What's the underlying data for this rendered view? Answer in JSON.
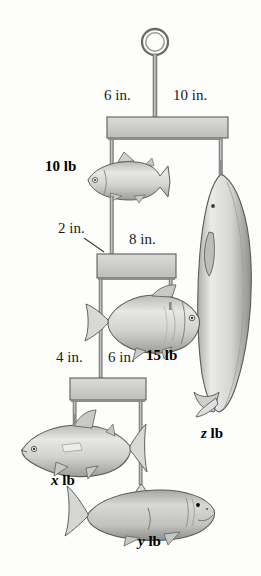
{
  "diagram": {
    "palette": {
      "beam_fill_light": "#d4d4d2",
      "beam_fill_dark": "#b4b4b2",
      "outline": "#4a4a4a",
      "rod": "#8c8c8c",
      "fish_light": "#efefed",
      "fish_mid": "#c8c8c6",
      "fish_dark": "#8f8f8d",
      "background": "#fdfdfc",
      "text": "#111111"
    },
    "hanger": {
      "ring_label": "support-ring",
      "ring_center_x": 155,
      "ring_center_y": 42,
      "ring_radius": 13
    },
    "beams": [
      {
        "name": "top-beam",
        "left_arm_in": 6,
        "right_arm_in": 10,
        "x": 107,
        "y": 117,
        "width": 121,
        "height": 21
      },
      {
        "name": "middle-beam",
        "left_arm_in": 2,
        "right_arm_in": 8,
        "x": 97,
        "y": 254,
        "width": 79,
        "height": 24
      },
      {
        "name": "bottom-beam",
        "left_arm_in": 4,
        "right_arm_in": 6,
        "x": 70,
        "y": 378,
        "width": 76,
        "height": 22
      }
    ],
    "dimension_labels": [
      {
        "id": "d1",
        "text": "6 in.",
        "x": 104,
        "y": 96
      },
      {
        "id": "d2",
        "text": "10 in.",
        "x": 175,
        "y": 96
      },
      {
        "id": "d3",
        "text": "2 in.",
        "x": 60,
        "y": 228
      },
      {
        "id": "d4",
        "text": "8 in.",
        "x": 130,
        "y": 238
      },
      {
        "id": "d5",
        "text": "4 in.",
        "x": 57,
        "y": 356
      },
      {
        "id": "d6",
        "text": "6 in.",
        "x": 109,
        "y": 356
      }
    ],
    "weight_labels": [
      {
        "id": "w1",
        "text": "10 lb",
        "x": 46,
        "y": 164,
        "kind": "known"
      },
      {
        "id": "w2",
        "text": "15 lb",
        "x": 147,
        "y": 352,
        "kind": "known"
      },
      {
        "id": "w3",
        "text": "x lb",
        "var": "x",
        "unit": "lb",
        "x": 51,
        "y": 477,
        "kind": "unknown"
      },
      {
        "id": "w4",
        "text": "y lb",
        "var": "y",
        "unit": "lb",
        "x": 139,
        "y": 538,
        "kind": "unknown"
      },
      {
        "id": "w5",
        "text": "z lb",
        "var": "z",
        "unit": "lb",
        "x": 201,
        "y": 430,
        "kind": "unknown"
      }
    ],
    "fish": [
      {
        "name": "fish-trout-10lb",
        "weight_label": "10 lb",
        "x": 88,
        "y": 158,
        "w": 78,
        "h": 44
      },
      {
        "name": "fish-whale-z",
        "weight_label": "z lb",
        "x": 197,
        "y": 172,
        "w": 56,
        "h": 242
      },
      {
        "name": "fish-carp-15lb",
        "weight_label": "15 lb",
        "x": 105,
        "y": 293,
        "w": 96,
        "h": 58
      },
      {
        "name": "fish-tuna-x",
        "weight_label": "x lb",
        "x": 20,
        "y": 420,
        "w": 122,
        "h": 58
      },
      {
        "name": "fish-shark-y",
        "weight_label": "y lb",
        "x": 84,
        "y": 488,
        "w": 132,
        "h": 54
      }
    ]
  }
}
